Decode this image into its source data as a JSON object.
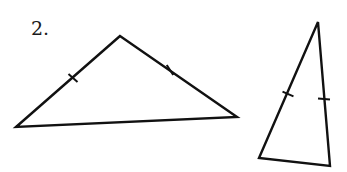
{
  "problem": {
    "number_label": "2.",
    "label_position": {
      "x": 31,
      "y": 19
    }
  },
  "style": {
    "stroke": "#111111",
    "stroke_width": 2.4,
    "background": "#ffffff"
  },
  "triangles": [
    {
      "name": "obtuse-isosceles-triangle",
      "vertices": [
        [
          120,
          36
        ],
        [
          16,
          127
        ],
        [
          237,
          117
        ]
      ],
      "congruent_marks": [
        {
          "x": 73,
          "y": 78,
          "angle": 49
        },
        {
          "x": 170,
          "y": 70,
          "angle": 33
        }
      ]
    },
    {
      "name": "acute-isosceles-triangle",
      "vertices": [
        [
          318,
          22
        ],
        [
          259,
          158
        ],
        [
          330,
          166
        ]
      ],
      "congruent_marks": [
        {
          "x": 288,
          "y": 94,
          "angle": 66
        },
        {
          "x": 324,
          "y": 99,
          "angle": 85
        }
      ]
    }
  ]
}
